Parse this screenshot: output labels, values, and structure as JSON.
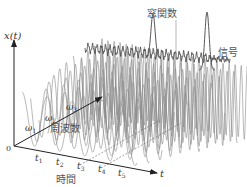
{
  "diagram": {
    "labels": {
      "signal_axis": "x(t)",
      "origin": "0",
      "time_axis_symbol": "t",
      "time_axis_label": "時間",
      "frequency_axis_label": "周波数",
      "window_function": "窓関数",
      "signal": "信号"
    },
    "time_ticks": [
      {
        "base": "t",
        "sub": "1"
      },
      {
        "base": "t",
        "sub": "2"
      },
      {
        "base": "t",
        "sub": "3"
      },
      {
        "base": "t",
        "sub": "4"
      },
      {
        "base": "t",
        "sub": "5"
      }
    ],
    "frequency_ticks": [
      {
        "base": "ω",
        "sub": "1"
      },
      {
        "base": "ω",
        "sub": "2"
      },
      {
        "base": "ω",
        "sub": "3"
      }
    ],
    "colors": {
      "axis": "#222222",
      "wave": "#8a8a8a",
      "signal": "#444444",
      "text": "#555555"
    }
  }
}
